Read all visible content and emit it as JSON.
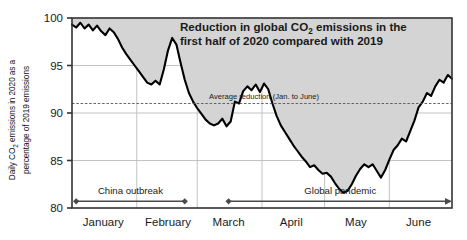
{
  "figure": {
    "title_line1": "Reduction in global CO",
    "title_line1_sub": "2",
    "title_line1_rest": " emissions in the",
    "title_line2": "first half of 2020 compared with 2019",
    "y_axis_label_part1": "Daily CO",
    "y_axis_label_sub": "2",
    "y_axis_label_part2": " emissions in 2020 as a",
    "y_axis_label_part3": "percentage of 2019 emissions",
    "average_line_label": "Average reduction (Jan. to June)",
    "annotation_china": "China outbreak",
    "annotation_global": "Global pandemic"
  },
  "colors": {
    "area_fill": "#d4d4d4",
    "line": "#000000",
    "grid": "#bcbcbc",
    "axis": "#333333",
    "dashed_line": "#555555",
    "annotation": "#4a4a4a",
    "text": "#1a1a1a",
    "background": "#ffffff"
  },
  "chart_data": {
    "type": "line",
    "title": "Reduction in global CO2 emissions in the first half of 2020 compared with 2019",
    "xlabel": "",
    "ylabel": "Daily CO2 emissions in 2020 as a percentage of 2019 emissions",
    "ylim": [
      80,
      100
    ],
    "yticks": [
      80,
      85,
      90,
      95,
      100
    ],
    "ytick_labels": [
      "80",
      "85",
      "90",
      "95",
      "100"
    ],
    "xlim": [
      0,
      182
    ],
    "xtick_labels": [
      "January",
      "February",
      "March",
      "April",
      "May",
      "June"
    ],
    "xtick_positions_days": [
      15,
      46,
      75,
      105,
      136,
      166
    ],
    "month_boundaries_days": [
      0,
      31,
      60,
      91,
      121,
      152,
      182
    ],
    "grid": true,
    "legend": null,
    "annotations": [
      {
        "name": "average-reduction-line",
        "type": "hline",
        "value": 91,
        "label": "Average reduction (Jan. to June)",
        "style": "dashed",
        "label_x_day": 92
      },
      {
        "name": "china-outbreak-span",
        "type": "span",
        "label": "China outbreak",
        "y_value": 80.7,
        "start_day": 2,
        "end_day": 54,
        "start_marker": "diamond",
        "end_marker": "diamond"
      },
      {
        "name": "global-pandemic-span",
        "type": "span",
        "label": "Global pandemic",
        "y_value": 80.7,
        "start_day": 75,
        "end_day": 182,
        "start_marker": "diamond",
        "end_marker": "arrow"
      }
    ],
    "series": [
      {
        "name": "Daily CO2 emissions (% of 2019)",
        "x": [
          0,
          2,
          4,
          6,
          8,
          10,
          12,
          14,
          16,
          18,
          20,
          22,
          24,
          26,
          28,
          30,
          32,
          34,
          36,
          38,
          40,
          42,
          44,
          46,
          48,
          50,
          52,
          54,
          56,
          58,
          60,
          62,
          64,
          66,
          68,
          70,
          72,
          74,
          76,
          78,
          80,
          82,
          84,
          86,
          88,
          90,
          92,
          94,
          96,
          98,
          100,
          102,
          104,
          106,
          108,
          110,
          112,
          114,
          116,
          118,
          120,
          122,
          124,
          126,
          128,
          130,
          132,
          134,
          136,
          138,
          140,
          142,
          144,
          146,
          148,
          150,
          152,
          154,
          156,
          158,
          160,
          162,
          164,
          166,
          168,
          170,
          172,
          174,
          176,
          178,
          180,
          182
        ],
        "values": [
          99.3,
          99.0,
          99.5,
          98.9,
          99.3,
          98.7,
          99.2,
          98.6,
          98.2,
          98.9,
          98.5,
          97.8,
          96.9,
          96.2,
          95.6,
          95.0,
          94.4,
          93.8,
          93.2,
          93.0,
          93.4,
          93.0,
          94.6,
          96.6,
          97.9,
          97.2,
          95.3,
          93.5,
          92.1,
          91.2,
          90.5,
          89.9,
          89.3,
          88.9,
          88.7,
          88.9,
          89.4,
          88.6,
          89.1,
          91.2,
          91.0,
          92.3,
          92.8,
          92.4,
          93.0,
          92.2,
          93.1,
          92.5,
          91.0,
          89.7,
          88.7,
          88.0,
          87.3,
          86.6,
          86.0,
          85.4,
          84.9,
          84.3,
          84.5,
          84.0,
          83.6,
          83.7,
          83.3,
          82.6,
          82.0,
          81.6,
          81.8,
          82.5,
          83.4,
          84.1,
          84.6,
          84.3,
          84.6,
          83.9,
          83.2,
          84.0,
          85.1,
          86.1,
          86.6,
          87.3,
          87.0,
          88.1,
          89.2,
          90.6,
          91.2,
          92.1,
          91.8,
          92.8,
          93.5,
          93.2,
          94.0,
          93.6
        ],
        "color": "#000000",
        "fill_above_to": 100,
        "fill_color": "#d4d4d4"
      }
    ]
  }
}
